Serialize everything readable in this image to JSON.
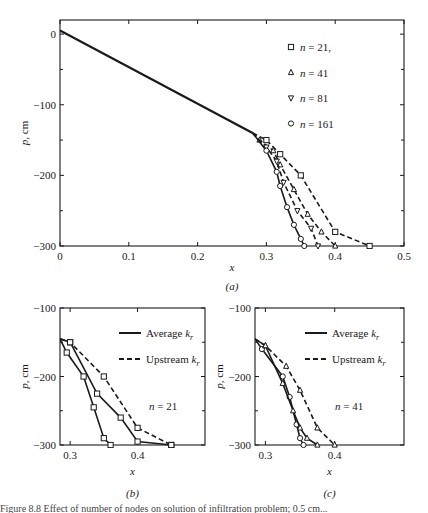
{
  "chart_data": [
    {
      "id": "a",
      "type": "line",
      "panel_label": "(a)",
      "xlabel": "x",
      "ylabel": "p, cm",
      "xlim": [
        0,
        0.5
      ],
      "ylim": [
        -300,
        20
      ],
      "xticks": [
        0,
        0.1,
        0.2,
        0.3,
        0.4,
        0.5
      ],
      "xtick_labels": [
        "0",
        "0.1",
        "0.2",
        "0.3",
        "0.4",
        "0.5"
      ],
      "yticks": [
        0,
        -100,
        -200,
        -300
      ],
      "ytick_labels": [
        "0",
        "−100",
        "−200",
        "−300"
      ],
      "grid": false,
      "legend_position": "upper right",
      "shared_path": {
        "x": [
          0,
          0.28
        ],
        "y": [
          5,
          -140
        ]
      },
      "series": [
        {
          "name": "n = 21,",
          "marker": "square",
          "dash": true,
          "x": [
            0.28,
            0.3,
            0.32,
            0.35,
            0.4,
            0.45
          ],
          "y": [
            -140,
            -150,
            -170,
            -200,
            -280,
            -300
          ]
        },
        {
          "name": "n = 41",
          "marker": "triangle-up",
          "dash": true,
          "x": [
            0.28,
            0.29,
            0.31,
            0.32,
            0.34,
            0.36,
            0.38,
            0.4
          ],
          "y": [
            -140,
            -150,
            -165,
            -185,
            -220,
            -255,
            -280,
            -300
          ]
        },
        {
          "name": "n = 81",
          "marker": "triangle-down",
          "dash": true,
          "x": [
            0.28,
            0.3,
            0.315,
            0.325,
            0.345,
            0.365,
            0.375
          ],
          "y": [
            -140,
            -160,
            -180,
            -210,
            -250,
            -275,
            -300
          ]
        },
        {
          "name": "n = 161",
          "marker": "circle",
          "dash": false,
          "x": [
            0.28,
            0.3,
            0.315,
            0.32,
            0.33,
            0.34,
            0.35,
            0.355
          ],
          "y": [
            -140,
            -165,
            -195,
            -215,
            -245,
            -270,
            -290,
            -300
          ]
        }
      ]
    },
    {
      "id": "b",
      "type": "line",
      "panel_label": "(b)",
      "xlabel": "x",
      "ylabel": "p, cm",
      "xlim": [
        0.285,
        0.5
      ],
      "ylim": [
        -300,
        -100
      ],
      "xticks": [
        0.3,
        0.4
      ],
      "xtick_labels": [
        "0.3",
        "0.4"
      ],
      "yticks": [
        -100,
        -200,
        -300
      ],
      "ytick_labels": [
        "−100",
        "−200",
        "−300"
      ],
      "annotation": "n = 21",
      "legend": [
        {
          "label": "Average",
          "subscript_label": "k",
          "sub": "r",
          "style": "solid"
        },
        {
          "label": "Upstream",
          "subscript_label": "k",
          "sub": "r",
          "style": "dashed"
        }
      ],
      "series": [
        {
          "name": "Average kr (coarse)",
          "marker": "square",
          "dash": false,
          "x": [
            0.285,
            0.295,
            0.32,
            0.335,
            0.35,
            0.36
          ],
          "y": [
            -145,
            -165,
            -200,
            -245,
            -290,
            -300
          ]
        },
        {
          "name": "Average kr (mid)",
          "marker": "square",
          "dash": false,
          "x": [
            0.285,
            0.3,
            0.34,
            0.375,
            0.4,
            0.45
          ],
          "y": [
            -145,
            -150,
            -225,
            -260,
            -295,
            -300
          ]
        },
        {
          "name": "Upstream kr",
          "marker": "square",
          "dash": true,
          "x": [
            0.285,
            0.3,
            0.35,
            0.4,
            0.45
          ],
          "y": [
            -145,
            -150,
            -200,
            -275,
            -300
          ]
        }
      ]
    },
    {
      "id": "c",
      "type": "line",
      "panel_label": "(c)",
      "xlabel": "x",
      "ylabel": "p, cm",
      "xlim": [
        0.285,
        0.5
      ],
      "ylim": [
        -300,
        -100
      ],
      "xticks": [
        0.3,
        0.4
      ],
      "xtick_labels": [
        "0.3",
        "0.4"
      ],
      "yticks": [
        -100,
        -200,
        -300
      ],
      "ytick_labels": [
        "−100",
        "−200",
        "−300"
      ],
      "annotation": "n = 41",
      "legend": [
        {
          "label": "Average",
          "subscript_label": "k",
          "sub": "r",
          "style": "solid"
        },
        {
          "label": "Upstream",
          "subscript_label": "k",
          "sub": "r",
          "style": "dashed"
        }
      ],
      "series": [
        {
          "name": "Average kr (circles)",
          "marker": "circle",
          "dash": false,
          "x": [
            0.285,
            0.295,
            0.325,
            0.335,
            0.345,
            0.35,
            0.355
          ],
          "y": [
            -145,
            -160,
            -200,
            -230,
            -270,
            -290,
            -300
          ]
        },
        {
          "name": "Average kr (triangles)",
          "marker": "triangle-up",
          "dash": false,
          "x": [
            0.285,
            0.3,
            0.325,
            0.34,
            0.35,
            0.36,
            0.375
          ],
          "y": [
            -145,
            -155,
            -210,
            -250,
            -275,
            -290,
            -300
          ]
        },
        {
          "name": "Upstream kr",
          "marker": "triangle-up",
          "dash": true,
          "x": [
            0.285,
            0.3,
            0.33,
            0.35,
            0.375,
            0.4
          ],
          "y": [
            -145,
            -155,
            -185,
            -220,
            -275,
            -300
          ]
        }
      ]
    }
  ],
  "caption": "Figure 8.8 Effect of number of nodes on solution of infiltration problem; 0.5 cm..."
}
